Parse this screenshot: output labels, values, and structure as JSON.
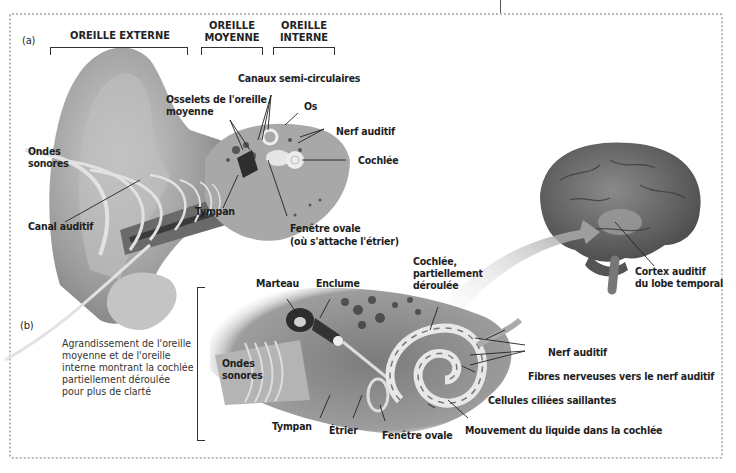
{
  "figure": {
    "panel_a": {
      "tag": "(a)",
      "sections": [
        {
          "id": "externe",
          "label": "OREILLE EXTERNE"
        },
        {
          "id": "moyenne",
          "label": "OREILLE\nMOYENNE"
        },
        {
          "id": "interne",
          "label": "OREILLE\nINTERNE"
        }
      ],
      "labels": {
        "canaux": "Canaux semi-circulaires",
        "osselets_1": "Osselets de l'oreille",
        "osselets_2": "moyenne",
        "os": "Os",
        "nerf": "Nerf auditif",
        "cochlee": "Cochlée",
        "ondes_1": "Ondes",
        "ondes_2": "sonores",
        "tympan": "Tympan",
        "canal": "Canal auditif",
        "fenetre_1": "Fenêtre ovale",
        "fenetre_2": "(où s'attache l'étrier)"
      }
    },
    "brain": {
      "cortex_1": "Cortex auditif",
      "cortex_2": "du lobe temporal"
    },
    "panel_b": {
      "tag": "(b)",
      "caption": [
        "Agrandissement de l'oreille",
        "moyenne et de l'oreille",
        "interne montrant la cochlée",
        "partiellement déroulée",
        "pour plus de clarté"
      ],
      "labels": {
        "marteau": "Marteau",
        "enclume": "Enclume",
        "cochlee_1": "Cochlée,",
        "cochlee_2": "partiellement",
        "cochlee_3": "déroulée",
        "ondes_1": "Ondes",
        "ondes_2": "sonores",
        "tympan": "Tympan",
        "etrier": "Étrier",
        "fenetre": "Fenêtre ovale",
        "nerf": "Nerf auditif",
        "fibres": "Fibres nerveuses vers le nerf auditif",
        "cellules": "Cellules ciliées saillantes",
        "mouvement": "Mouvement du liquide dans la cochlée"
      }
    }
  }
}
